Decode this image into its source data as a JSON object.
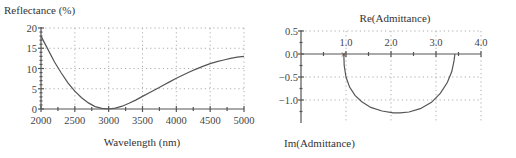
{
  "chart_data": [
    {
      "type": "line",
      "title": "",
      "ylabel": "Reflectance (%)",
      "xlabel": "Wavelength (nm)",
      "xlim": [
        2000,
        5000
      ],
      "ylim": [
        0,
        20
      ],
      "xticks": [
        2000,
        2500,
        3000,
        3500,
        4000,
        4500,
        5000
      ],
      "xtick_labels": [
        "2000",
        "2500",
        "3000",
        "3500",
        "4000",
        "4500",
        "5000"
      ],
      "yticks": [
        0,
        5,
        10,
        15,
        20
      ],
      "ytick_labels": [
        "0",
        "5",
        "10",
        "15",
        "20"
      ],
      "grid": true,
      "series": [
        {
          "name": "Reflectance",
          "x": [
            2000,
            2100,
            2200,
            2300,
            2400,
            2500,
            2600,
            2700,
            2800,
            2900,
            3000,
            3100,
            3200,
            3300,
            3400,
            3500,
            3600,
            3700,
            3800,
            3900,
            4000,
            4100,
            4200,
            4300,
            4400,
            4500,
            4600,
            4700,
            4800,
            4900,
            5000
          ],
          "y": [
            18.0,
            14.8,
            11.6,
            8.9,
            6.4,
            4.4,
            2.8,
            1.5,
            0.6,
            0.15,
            0.0,
            0.2,
            0.7,
            1.4,
            2.2,
            3.1,
            4.0,
            4.9,
            5.8,
            6.7,
            7.6,
            8.4,
            9.2,
            9.9,
            10.6,
            11.2,
            11.7,
            12.1,
            12.5,
            12.8,
            13.0
          ]
        }
      ]
    },
    {
      "type": "line",
      "title": "",
      "xlabel": "Re(Admittance)",
      "ylabel": "Im(Admittance)",
      "xlim": [
        0,
        4.0
      ],
      "ylim": [
        -1.5,
        0.5
      ],
      "xticks": [
        1.0,
        2.0,
        3.0,
        4.0
      ],
      "xtick_labels": [
        "1.0",
        "2.0",
        "3.0",
        "4.0"
      ],
      "yticks": [
        0.5,
        0.0,
        -0.5,
        -1.0
      ],
      "ytick_labels": [
        "0.5",
        "0.0",
        "−0.5",
        "−1.0"
      ],
      "grid": true,
      "start_marker": {
        "label": "×",
        "x": 0.95,
        "y": 0.0
      },
      "series": [
        {
          "name": "Admittance locus",
          "x": [
            0.95,
            0.96,
            1.0,
            1.08,
            1.2,
            1.35,
            1.55,
            1.8,
            2.05,
            2.2,
            2.4,
            2.65,
            2.9,
            3.1,
            3.25,
            3.35,
            3.4,
            3.42
          ],
          "y": [
            0.0,
            -0.25,
            -0.5,
            -0.72,
            -0.9,
            -1.04,
            -1.16,
            -1.24,
            -1.28,
            -1.28,
            -1.26,
            -1.19,
            -1.05,
            -0.85,
            -0.62,
            -0.38,
            -0.15,
            0.0
          ]
        }
      ]
    }
  ]
}
